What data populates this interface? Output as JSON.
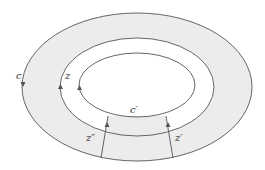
{
  "figure": {
    "colors": {
      "shade": "#ececec",
      "stroke": "#555555",
      "background": "#ffffff"
    },
    "labels": {
      "outer_curve": "c",
      "middle_curve": "z",
      "inner_curve_segment": "c′",
      "left_cut": "z″",
      "right_cut": "z′"
    },
    "curves": {
      "outer": {
        "cx": 137,
        "cy": 87,
        "rx": 115,
        "ry": 74,
        "orientation": "down-on-left"
      },
      "middle": {
        "cx": 137,
        "cy": 87,
        "rx": 77,
        "ry": 49,
        "orientation": "up-on-left"
      },
      "inner": {
        "cx": 137,
        "cy": 85,
        "rx": 58,
        "ry": 32,
        "orientation": "up-on-left"
      }
    }
  }
}
